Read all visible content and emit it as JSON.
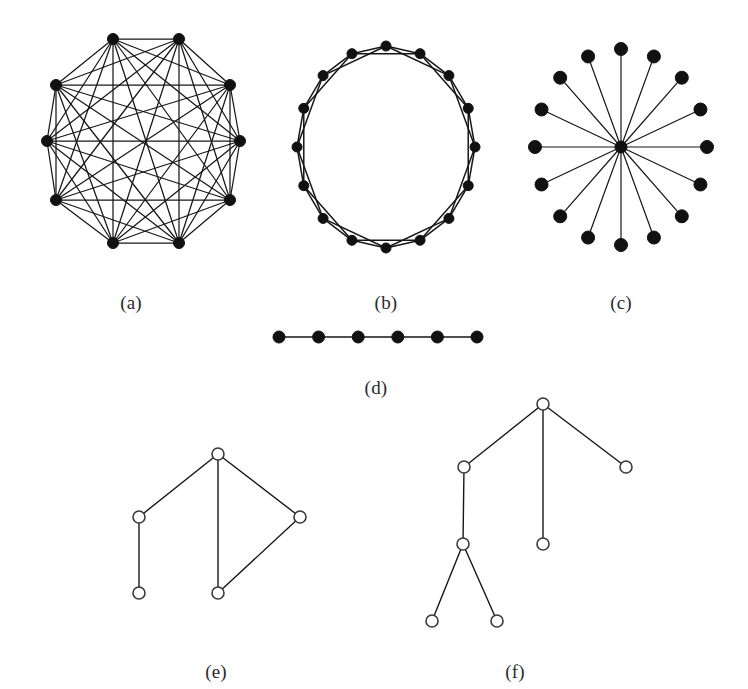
{
  "figure": {
    "background_color": "#ffffff",
    "ink_color": "#171717",
    "node_fill_dark": "#111111",
    "node_fill_light": "#ffffff",
    "node_stroke_light": "#3a3a3a",
    "width": 748,
    "height": 689
  },
  "captions": {
    "a": "(a)",
    "b": "(b)",
    "c": "(c)",
    "d": "(d)",
    "e": "(e)",
    "f": "(f)"
  },
  "caption_positions": {
    "a": {
      "x": 131,
      "y": 292
    },
    "b": {
      "x": 386,
      "y": 292
    },
    "c": {
      "x": 621,
      "y": 292
    },
    "d": {
      "x": 376,
      "y": 377
    },
    "e": {
      "x": 216,
      "y": 661
    },
    "f": {
      "x": 515,
      "y": 661
    }
  },
  "panels": [
    {
      "id": "a",
      "name": "complete-graph",
      "kind": "complete",
      "node_style": "filled",
      "node_radius": 5.5,
      "edge_width": 1.25,
      "center": {
        "x": 143,
        "y": 141
      },
      "radius_x": 96,
      "radius_y": 107,
      "node_count": 10,
      "start_angle_deg": -108,
      "nodes": [
        {
          "id": 0,
          "x": 113,
          "y": 39
        },
        {
          "id": 1,
          "x": 179,
          "y": 39
        },
        {
          "id": 2,
          "x": 230,
          "y": 85
        },
        {
          "id": 3,
          "x": 240,
          "y": 141
        },
        {
          "id": 4,
          "x": 230,
          "y": 200
        },
        {
          "id": 5,
          "x": 179,
          "y": 243
        },
        {
          "id": 6,
          "x": 113,
          "y": 243
        },
        {
          "id": 7,
          "x": 56,
          "y": 200
        },
        {
          "id": 8,
          "x": 47,
          "y": 141
        },
        {
          "id": 9,
          "x": 56,
          "y": 85
        }
      ]
    },
    {
      "id": "b",
      "name": "circulant-ring-graph",
      "kind": "circulant",
      "node_style": "filled",
      "node_radius": 5.0,
      "edge_width": 1.5,
      "center": {
        "x": 386,
        "y": 147
      },
      "radius_x": 89,
      "radius_y": 101,
      "node_count": 16,
      "chord_offsets": [
        1,
        2
      ],
      "start_angle_deg": -90
    },
    {
      "id": "c",
      "name": "star-graph",
      "kind": "star",
      "node_style": "filled",
      "node_radius": 6.5,
      "hub_radius": 6.0,
      "edge_width": 1.2,
      "center": {
        "x": 621,
        "y": 147
      },
      "radius_x": 86,
      "radius_y": 98,
      "leaf_count": 16,
      "start_angle_deg": -90
    },
    {
      "id": "d",
      "name": "path-graph",
      "kind": "path",
      "node_style": "filled",
      "node_radius": 6.0,
      "edge_width": 1.6,
      "y": 337,
      "x_start": 279,
      "x_end": 477,
      "node_count": 6
    },
    {
      "id": "e",
      "name": "irregular-graph",
      "kind": "explicit",
      "node_style": "hollow",
      "node_radius": 6.0,
      "edge_width": 1.4,
      "nodes": [
        {
          "id": "top",
          "x": 218,
          "y": 454
        },
        {
          "id": "left-mid",
          "x": 139,
          "y": 517
        },
        {
          "id": "bottom-left",
          "x": 139,
          "y": 593
        },
        {
          "id": "right",
          "x": 300,
          "y": 517
        },
        {
          "id": "bottom-mid",
          "x": 218,
          "y": 593
        }
      ],
      "edges": [
        [
          "top",
          "left-mid"
        ],
        [
          "left-mid",
          "bottom-left"
        ],
        [
          "top",
          "bottom-mid"
        ],
        [
          "top",
          "right"
        ],
        [
          "right",
          "bottom-mid"
        ]
      ]
    },
    {
      "id": "f",
      "name": "tree-graph",
      "kind": "explicit",
      "node_style": "hollow",
      "node_radius": 6.0,
      "edge_width": 1.4,
      "nodes": [
        {
          "id": "root",
          "x": 543,
          "y": 404
        },
        {
          "id": "child-left",
          "x": 464,
          "y": 467
        },
        {
          "id": "child-right",
          "x": 626,
          "y": 467
        },
        {
          "id": "child-mid-leaf",
          "x": 543,
          "y": 544
        },
        {
          "id": "grandchild",
          "x": 463,
          "y": 544
        },
        {
          "id": "leaf-bottom-left",
          "x": 432,
          "y": 621
        },
        {
          "id": "leaf-bottom-right",
          "x": 497,
          "y": 621
        }
      ],
      "edges": [
        [
          "root",
          "child-left"
        ],
        [
          "root",
          "child-mid-leaf"
        ],
        [
          "root",
          "child-right"
        ],
        [
          "child-left",
          "grandchild"
        ],
        [
          "grandchild",
          "leaf-bottom-left"
        ],
        [
          "grandchild",
          "leaf-bottom-right"
        ]
      ]
    }
  ]
}
